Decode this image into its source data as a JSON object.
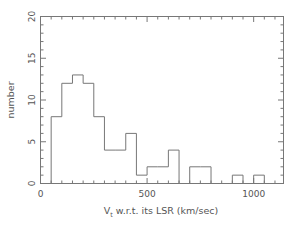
{
  "chart_data": {
    "type": "bar",
    "title": "",
    "subtitle": "",
    "xlabel": "V_t w.r.t. its LSR (km/sec)",
    "xlabel_main_pre": "V",
    "xlabel_sub": "t",
    "xlabel_main_post": " w.r.t. its LSR (km/sec)",
    "ylabel": "number",
    "xlim": [
      0,
      1140
    ],
    "ylim": [
      0,
      20
    ],
    "grid": false,
    "legend": null,
    "bin_width": 50,
    "bin_edges": [
      0,
      50,
      100,
      150,
      200,
      250,
      300,
      350,
      400,
      450,
      500,
      550,
      600,
      650,
      700,
      750,
      800,
      850,
      900,
      950,
      1000,
      1050
    ],
    "categories": [
      "0-50",
      "50-100",
      "100-150",
      "150-200",
      "200-250",
      "250-300",
      "300-350",
      "350-400",
      "400-450",
      "450-500",
      "500-550",
      "550-600",
      "600-650",
      "650-700",
      "700-750",
      "750-800",
      "800-850",
      "850-900",
      "900-950",
      "950-1000",
      "1000-1050"
    ],
    "values": [
      0,
      8,
      12,
      13,
      12,
      8,
      4,
      4,
      6,
      1,
      2,
      2,
      4,
      0,
      2,
      2,
      0,
      0,
      1,
      0,
      1
    ],
    "xticks_major": [
      0,
      500,
      1000
    ],
    "xtick_labels": [
      "0",
      "500",
      "1000"
    ],
    "xticks_minor_step": 50,
    "yticks_major": [
      0,
      5,
      10,
      15,
      20
    ],
    "ytick_labels": [
      "0",
      "5",
      "10",
      "15",
      "20"
    ],
    "yticks_minor_step": 1,
    "colors": {
      "axis": "#777777",
      "histogram_line": "#777777",
      "background": "#ffffff",
      "text": "#555555"
    }
  }
}
